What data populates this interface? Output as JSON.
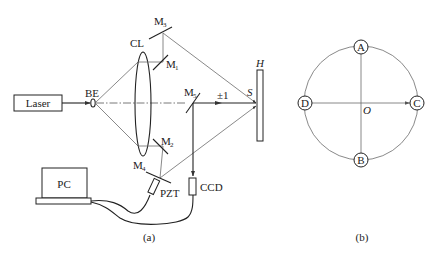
{
  "figure_a": {
    "caption": "(a)",
    "components": {
      "laser": "Laser",
      "beam_expander": "BE",
      "collimating_lens": "CL",
      "mirror_1": {
        "base": "M",
        "sub": "1"
      },
      "mirror_2": {
        "base": "M",
        "sub": "2"
      },
      "mirror_3": {
        "base": "M",
        "sub": "3"
      },
      "mirror_4": {
        "base": "M",
        "sub": "4"
      },
      "mirror_5": {
        "base": "M",
        "sub": "5"
      },
      "hologram": "H",
      "sample_point": "S",
      "diffraction_order": "±1",
      "camera": "CCD",
      "piezo": "PZT",
      "computer": "PC"
    }
  },
  "figure_b": {
    "caption": "(b)",
    "points": {
      "top": "A",
      "bottom": "B",
      "right": "C",
      "left": "D",
      "center": "O"
    }
  }
}
